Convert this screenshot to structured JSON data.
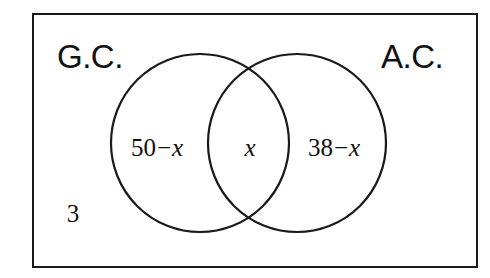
{
  "diagram": {
    "type": "venn-two-set",
    "title": "",
    "universal_set_region": {
      "outside_count_label": "3"
    },
    "sets": [
      {
        "id": "left",
        "label": "G.C.",
        "region_label_plain": "50 - x",
        "region_label_parts": {
          "number": "50",
          "operator": "−",
          "variable": "x"
        }
      },
      {
        "id": "right",
        "label": "A.C.",
        "region_label_plain": "38 - x",
        "region_label_parts": {
          "number": "38",
          "operator": "−",
          "variable": "x"
        }
      }
    ],
    "intersection": {
      "label": "x"
    },
    "colors": {
      "stroke": "#1a1a1a",
      "background": "#ffffff",
      "text": "#111111"
    },
    "geometry": {
      "frame": {
        "x": 32,
        "y": 13,
        "width": 446,
        "height": 255
      },
      "left_circle": {
        "cx": 200,
        "cy": 143,
        "r": 89
      },
      "right_circle": {
        "cx": 297,
        "cy": 143,
        "r": 89
      }
    }
  }
}
